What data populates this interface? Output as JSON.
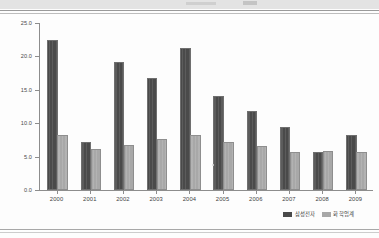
{
  "chart_data": {
    "type": "bar",
    "title": "",
    "xlabel": "",
    "ylabel": "",
    "categories": [
      "2000",
      "2001",
      "2002",
      "2003",
      "2004",
      "2005",
      "2006",
      "2007",
      "2008",
      "2009"
    ],
    "series": [
      {
        "name": "삼성전자",
        "color": "#4a4a4a",
        "values": [
          22.2,
          6.9,
          18.8,
          16.4,
          21.0,
          13.8,
          11.5,
          9.1,
          5.4,
          8.0
        ]
      },
      {
        "name": "화학업계",
        "color": "#a8a8a8",
        "values": [
          7.9,
          5.8,
          6.5,
          7.3,
          8.0,
          6.9,
          6.3,
          5.4,
          5.6,
          5.4
        ]
      }
    ],
    "ylim": [
      0.0,
      25.0
    ],
    "ytick_labels": [
      "0.0",
      "5.0",
      "10.0",
      "15.0",
      "20.0",
      "25.0"
    ],
    "ytick_values": [
      0,
      5,
      10,
      15,
      20,
      25
    ],
    "grid": false,
    "legend_position": "bottom-right"
  },
  "axis": {
    "y_ticks": [
      {
        "label": "25.0",
        "value": 25
      },
      {
        "label": "20.0",
        "value": 20
      },
      {
        "label": "15.0",
        "value": 15
      },
      {
        "label": "10.0",
        "value": 10
      },
      {
        "label": "5.0",
        "value": 5
      },
      {
        "label": "0.0",
        "value": 0
      }
    ]
  },
  "legend": {
    "entries": [
      {
        "label": "삼성전자",
        "swatch": "dark-swatch"
      },
      {
        "label": "화학업계",
        "swatch": "gray-swatch"
      }
    ]
  }
}
